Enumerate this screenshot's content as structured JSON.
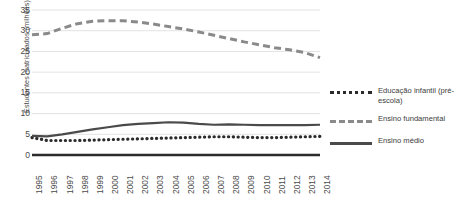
{
  "chart_data": {
    "type": "line",
    "title": "",
    "xlabel": "",
    "ylabel": "Estudantes matriculados (milhões)",
    "ylim": [
      0,
      35
    ],
    "yticks": [
      0,
      5,
      10,
      15,
      20,
      25,
      30,
      35
    ],
    "grid": true,
    "legend_position": "right",
    "categories": [
      "1995",
      "1996",
      "1997",
      "1998",
      "1999",
      "2000",
      "2001",
      "2002",
      "2003",
      "2004",
      "2005",
      "2006",
      "2007",
      "2008",
      "2009",
      "2010",
      "2011",
      "2012",
      "2013",
      "2014"
    ],
    "series": [
      {
        "name": "Educação infantil (pré-escola)",
        "style": "dotted",
        "color": "#2b2b2b",
        "values": [
          4.2,
          3.5,
          3.5,
          3.5,
          3.6,
          3.7,
          3.8,
          3.9,
          4.0,
          4.1,
          4.2,
          4.3,
          4.4,
          4.4,
          4.3,
          4.2,
          4.2,
          4.3,
          4.4,
          4.5
        ]
      },
      {
        "name": "Ensino fundamental",
        "style": "dashed",
        "color": "#8a8a8a",
        "values": [
          29.0,
          29.3,
          30.6,
          31.7,
          32.3,
          32.4,
          32.4,
          32.1,
          31.6,
          31.0,
          30.4,
          29.7,
          28.9,
          28.1,
          27.3,
          26.6,
          25.9,
          25.4,
          24.7,
          23.5
        ]
      },
      {
        "name": "Ensino médio",
        "style": "solid",
        "color": "#4a4a4a",
        "values": [
          4.6,
          4.5,
          5.0,
          5.6,
          6.2,
          6.7,
          7.2,
          7.5,
          7.7,
          7.9,
          7.8,
          7.5,
          7.3,
          7.4,
          7.3,
          7.2,
          7.2,
          7.2,
          7.2,
          7.3
        ]
      }
    ]
  }
}
